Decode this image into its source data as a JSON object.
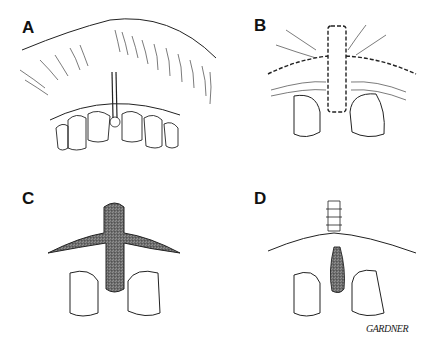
{
  "figure": {
    "type": "surgical illustration",
    "panels": [
      {
        "label": "A",
        "description": "Upper lip and maxillary anterior teeth with prominent labial frenum inserting between central incisors"
      },
      {
        "label": "B",
        "description": "Dashed incision lines outlining frenum excision and horizontal vestibular incision"
      },
      {
        "label": "C",
        "description": "Excised area shown as stippled T-shaped wound"
      },
      {
        "label": "D",
        "description": "Sutured closure with remaining stippled interdental area"
      }
    ],
    "signature": "GARDNER"
  },
  "colors": {
    "line": "#222222",
    "background": "#ffffff",
    "stipple": "#9a9a9a"
  }
}
